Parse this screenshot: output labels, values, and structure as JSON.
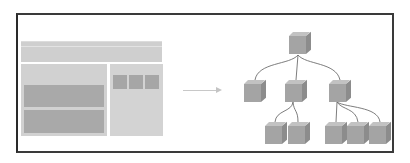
{
  "diagram": {
    "frame": {
      "border_color": "#3a3a3a",
      "background": "#ffffff"
    },
    "wireframe": {
      "header": {
        "color": "#cfcfcf"
      },
      "left_panel": {
        "color": "#d1d1d1",
        "blocks": 2,
        "block_color": "#a9a9a9"
      },
      "right_panel": {
        "color": "#d3d3d3",
        "squares": 3,
        "square_color": "#a6a6a6"
      }
    },
    "arrow": {
      "direction": "right",
      "color": "#c4c4c4"
    },
    "tree": {
      "node_color": "#a4a4a4",
      "levels": [
        {
          "level": 0,
          "nodes": [
            "root"
          ]
        },
        {
          "level": 1,
          "nodes": [
            "child-1",
            "child-2",
            "child-3"
          ]
        },
        {
          "level": 2,
          "nodes": [
            "child-2-a",
            "child-2-b",
            "child-3-a",
            "child-3-b",
            "child-3-c"
          ]
        }
      ],
      "edges": [
        [
          "root",
          "child-1"
        ],
        [
          "root",
          "child-2"
        ],
        [
          "root",
          "child-3"
        ],
        [
          "child-2",
          "child-2-a"
        ],
        [
          "child-2",
          "child-2-b"
        ],
        [
          "child-3",
          "child-3-a"
        ],
        [
          "child-3",
          "child-3-b"
        ],
        [
          "child-3",
          "child-3-c"
        ]
      ]
    }
  }
}
